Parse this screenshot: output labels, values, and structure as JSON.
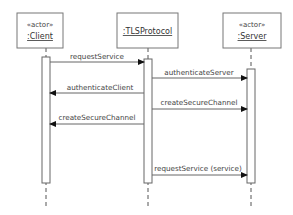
{
  "diagram": {
    "type": "UML sequence diagram",
    "participants": [
      {
        "id": "client",
        "stereotype": "«actor»",
        "name": ":Client"
      },
      {
        "id": "tls",
        "stereotype": "",
        "name": ":TLSProtocol"
      },
      {
        "id": "server",
        "stereotype": "«actor»",
        "name": ":Server"
      }
    ],
    "messages": [
      {
        "label": "requestService",
        "from": "client",
        "to": "tls"
      },
      {
        "label": "authenticateServer",
        "from": "tls",
        "to": "server"
      },
      {
        "label": "authenticateClient",
        "from": "tls",
        "to": "client"
      },
      {
        "label": "createSecureChannel",
        "from": "tls",
        "to": "server"
      },
      {
        "label": "createSecureChannel",
        "from": "tls",
        "to": "client"
      },
      {
        "label": "requestService (service)",
        "from": "tls",
        "to": "server"
      }
    ],
    "colors": {
      "line": "#666666",
      "background": "#ffffff",
      "text": "#444444"
    }
  }
}
